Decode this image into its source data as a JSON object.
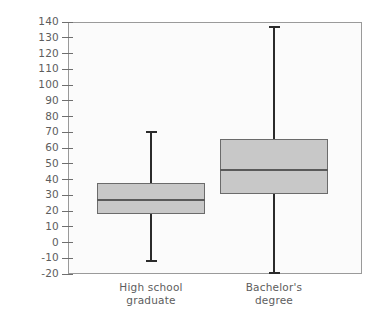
{
  "chart_data": {
    "type": "box",
    "title": "",
    "xlabel": "",
    "ylabel": "Income, thousands of dollars",
    "ylim": [
      -20,
      140
    ],
    "ytick_step": 10,
    "yticks": [
      140,
      130,
      120,
      110,
      100,
      90,
      80,
      70,
      60,
      50,
      40,
      30,
      20,
      10,
      0,
      -10,
      -20
    ],
    "ytick_labels": [
      "140",
      "130",
      "120",
      "110",
      "100",
      "90",
      "80",
      "70",
      "60",
      "50",
      "40",
      "30",
      "20",
      "10",
      "0",
      "-10",
      "-20"
    ],
    "categories": [
      "High school graduate",
      "Bachelor's degree"
    ],
    "grid": false,
    "legend": "none",
    "boxes": [
      {
        "category": "High school graduate",
        "label_line1": "High school",
        "label_line2": "graduate",
        "min": -12,
        "q1": 18,
        "median": 27,
        "q3": 38,
        "max": 70
      },
      {
        "category": "Bachelor's degree",
        "label_line1": "Bachelor's",
        "label_line2": "degree",
        "min": -19.5,
        "q1": 31,
        "median": 46,
        "q3": 66,
        "max": 137
      }
    ],
    "colors": {
      "box_fill": "#c8c8c8",
      "box_border": "#6b6b6b",
      "median": "#5a5a5a",
      "whisker": "#2b2b2b",
      "frame": "#9a9a9a",
      "plot_background": "#fbfbfb",
      "text": "#5d5d5d"
    }
  }
}
